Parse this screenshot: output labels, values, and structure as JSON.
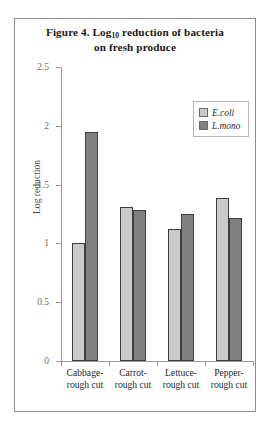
{
  "chart_data": {
    "type": "bar",
    "title": "Figure 4. Log10 reduction of bacteria on fresh produce",
    "title_line1_pre": "Figure 4. Log",
    "title_line1_sub": "10",
    "title_line1_post": " reduction of bacteria",
    "title_line2": "on fresh produce",
    "xlabel": "",
    "ylabel": "Log reduction",
    "ylim": [
      0,
      2.5
    ],
    "ytick_labels": [
      "0",
      "0.5",
      "1",
      "1.5",
      "2",
      "2.5"
    ],
    "ytick_values": [
      0,
      0.5,
      1,
      1.5,
      2,
      2.5
    ],
    "grid": false,
    "legend_position": "upper right",
    "categories": [
      "Cabbage- rough cut",
      "Carrot- rough cut",
      "Lettuce- rough cut",
      "Pepper- rough cut"
    ],
    "category_lines": [
      [
        "Cabbage-",
        "rough cut"
      ],
      [
        "Carrot-",
        "rough cut"
      ],
      [
        "Lettuce-",
        "rough cut"
      ],
      [
        "Pepper-",
        "rough cut"
      ]
    ],
    "series": [
      {
        "name": "E.coli",
        "color": "#c9c9c9",
        "values": [
          1.0,
          1.31,
          1.12,
          1.39
        ]
      },
      {
        "name": "L.mono",
        "color": "#808080",
        "values": [
          1.95,
          1.28,
          1.25,
          1.22
        ]
      }
    ]
  }
}
